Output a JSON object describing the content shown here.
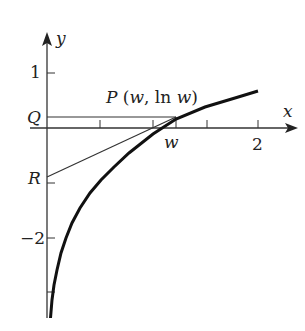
{
  "figure": {
    "type": "function-graph",
    "function": "y = ln x",
    "axes": {
      "x_label": "x",
      "y_label": "y",
      "x_ticks": [
        0.5,
        1,
        1.5,
        2
      ],
      "x_tick_labels": {
        "2": "2"
      },
      "y_ticks": [
        1,
        -1,
        -2,
        -3
      ],
      "y_tick_labels": {
        "1": "1",
        "-2": "−2"
      }
    },
    "points": {
      "P": {
        "label": "P (w, ln w)",
        "name": "P",
        "coords": "(w, ln w)"
      },
      "Q": {
        "label": "Q"
      },
      "R": {
        "label": "R"
      },
      "w": {
        "label": "w"
      }
    },
    "labels": {
      "y_axis": "y",
      "x_axis": "x",
      "one": "1",
      "two": "2",
      "minus_two": "−2",
      "Q": "Q",
      "R": "R",
      "w": "w",
      "P_name": "P",
      "P_open": " (",
      "P_w": "w",
      "P_mid": ", ln ",
      "P_w2": "w",
      "P_close": ")"
    },
    "colors": {
      "ink": "#222222",
      "background": "#ffffff"
    }
  }
}
